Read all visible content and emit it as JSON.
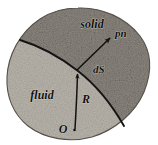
{
  "figure": {
    "name": "fluid-solid-interface-diagram",
    "caption_labels": {
      "solid": "solid",
      "fluid": "fluid",
      "normal_vector": "pn",
      "surface_element": "dS",
      "radius_vector": "R",
      "origin": "O"
    },
    "colors": {
      "solid_region": "#8d8880",
      "fluid_region": "#b9b5ac",
      "outline": "#4a453e",
      "interface_curve": "#151515",
      "arrow": "#111111",
      "text": "#111111",
      "background": "#ffffff"
    },
    "regions": [
      {
        "id": "solid",
        "label": "solid",
        "position": "upper-right",
        "shade": "dark",
        "label_x": 92,
        "label_y": 28
      },
      {
        "id": "fluid",
        "label": "fluid",
        "position": "lower-left",
        "shade": "light",
        "label_x": 42,
        "label_y": 99
      }
    ],
    "annotations": [
      {
        "id": "normal-vector",
        "label": "pn",
        "type": "arrow",
        "from_x": 78,
        "from_y": 71,
        "to_x": 112,
        "to_y": 36,
        "label_x": 117,
        "label_y": 36
      },
      {
        "id": "surface-element",
        "label": "dS",
        "type": "text",
        "label_x": 97,
        "label_y": 71
      },
      {
        "id": "radius-vector",
        "label": "R",
        "type": "arrow",
        "from_x": 75,
        "from_y": 128,
        "to_x": 77,
        "to_y": 70,
        "label_x": 87,
        "label_y": 101
      },
      {
        "id": "origin",
        "label": "O",
        "type": "point",
        "label_x": 63,
        "label_y": 131
      }
    ],
    "shape": {
      "outline_type": "tilted-ellipse",
      "center_x": 78,
      "center_y": 73,
      "radius_x": 72,
      "radius_y": 63,
      "rotation_deg": -22
    },
    "interface": {
      "description": "boundary curve separating fluid and solid",
      "start_x": 20,
      "start_y": 40,
      "end_x": 124,
      "end_y": 126
    }
  }
}
